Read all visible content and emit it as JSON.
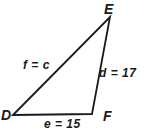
{
  "figure": {
    "type": "triangle-diagram",
    "background": "#ffffff",
    "stroke_color": "#1a1a1a",
    "triangle_points": "13,115 110,17 92,114",
    "vertices": {
      "D": {
        "label": "D"
      },
      "E": {
        "label": "E"
      },
      "F": {
        "label": "F"
      }
    },
    "sides": {
      "DE": {
        "label": "f = c"
      },
      "EF": {
        "label": "d = 17"
      },
      "DF": {
        "label": "e = 15"
      }
    }
  }
}
